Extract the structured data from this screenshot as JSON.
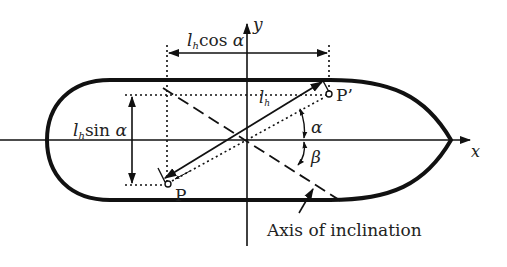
{
  "diagram": {
    "type": "geometry",
    "labels": {
      "cos_label_l": "l",
      "cos_label_sub": "h",
      "cos_label_rest": "cos ",
      "cos_label_alpha": "α",
      "sin_label_l": "l",
      "sin_label_sub": "h",
      "sin_label_rest": "sin ",
      "sin_label_alpha": "α",
      "lh_l": "l",
      "lh_sub": "h",
      "point_p": "P",
      "point_p_prime": "P’",
      "alpha": "α",
      "beta": "β",
      "x_axis": "x",
      "y_axis": "y",
      "axis_of_inclination": "Axis of inclination"
    },
    "colors": {
      "stroke": "#111111",
      "text": "#222222",
      "background": "#ffffff"
    }
  }
}
